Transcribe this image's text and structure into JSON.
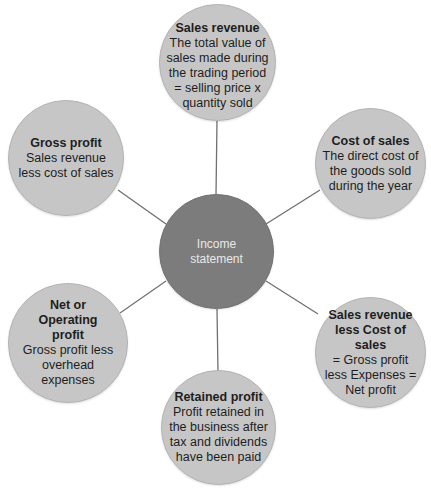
{
  "diagram": {
    "center": {
      "label": "Income\nstatement",
      "color": "#7c7c7c"
    },
    "node_color": "#c6c6c6",
    "line_color": "#707070",
    "nodes": [
      {
        "id": "sales-revenue",
        "title": "Sales revenue",
        "description": "The total value of sales made during the trading period = selling price x quantity sold"
      },
      {
        "id": "cost-of-sales",
        "title": "Cost of sales",
        "description": "The direct cost of the goods sold during the year"
      },
      {
        "id": "sales-revenue-less-cost",
        "title": "Sales revenue less Cost of sales",
        "description": "= Gross profit less Expenses = Net profit"
      },
      {
        "id": "retained-profit",
        "title": "Retained profit",
        "description": "Profit retained in the business after tax and dividends have been paid"
      },
      {
        "id": "net-operating-profit",
        "title": "Net or Operating profit",
        "description": "Gross profit less overhead expenses"
      },
      {
        "id": "gross-profit",
        "title": "Gross profit",
        "description": "Sales revenue less cost of sales"
      }
    ]
  }
}
